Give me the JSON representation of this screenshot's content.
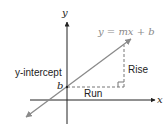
{
  "diagram": {
    "equation_label": "y = mx + b",
    "y_axis_label": "y",
    "x_axis_label": "x",
    "intercept_label": "y-intercept",
    "b_label": "b",
    "rise_label": "Rise",
    "run_label": "Run"
  },
  "colors": {
    "axis": "#222222",
    "line": "#8a8a8a",
    "dashed": "#777777",
    "text": "#222222",
    "equation_text": "#8a8a8a"
  }
}
